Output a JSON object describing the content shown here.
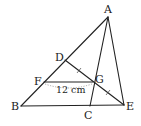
{
  "figure": {
    "type": "geometry-diagram",
    "points": {
      "A": {
        "label": "A",
        "x": 108,
        "y": 17
      },
      "B": {
        "label": "B",
        "x": 21,
        "y": 106
      },
      "C": {
        "label": "C",
        "x": 90,
        "y": 106
      },
      "D": {
        "label": "D",
        "x": 65,
        "y": 60
      },
      "E": {
        "label": "E",
        "x": 124,
        "y": 105
      },
      "F": {
        "label": "F",
        "x": 44,
        "y": 82
      },
      "G": {
        "label": "G",
        "x": 93,
        "y": 82
      }
    },
    "segments": [
      "AB",
      "BE",
      "AE",
      "AC",
      "DE",
      "FG"
    ],
    "equal_marks": [
      "DG",
      "GE"
    ],
    "measurement": {
      "segment": "FG",
      "text": "12 cm"
    },
    "stroke_color": "#222222"
  }
}
